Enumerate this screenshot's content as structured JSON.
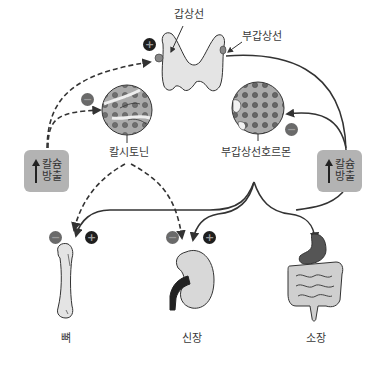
{
  "labels": {
    "thyroid": "갑상선",
    "parathyroid": "부갑상선",
    "calcitonin": "칼시토닌",
    "pth": "부갑상선호르몬",
    "bone": "뼈",
    "kidney": "신장",
    "intestine": "소장"
  },
  "boxes": {
    "left": {
      "line1": "칼슘",
      "line2": "방출",
      "icon": "up-arrow-icon"
    },
    "right": {
      "line1": "칼슘",
      "line2": "방출",
      "icon": "up-arrow-icon"
    }
  },
  "signs": {
    "thyroid_plus": "+",
    "calcitonin_minus": "−",
    "pth_minus": "−",
    "bone_minus": "−",
    "bone_plus": "+",
    "kidney_minus": "−",
    "kidney_plus": "+"
  },
  "colors": {
    "line": "#333333",
    "box": "#b3b3b3",
    "organ_fill": "#e4e4e4",
    "cell_fill": "#9c9c9c",
    "plus": "#1e1e1e",
    "minus": "#6a6a6a"
  }
}
